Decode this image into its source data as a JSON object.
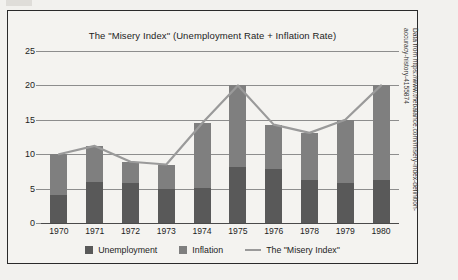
{
  "source_credit": {
    "line1": "Data from https://www.thebalance.com/misery-index-definition-",
    "line2": "accuracy-history-4155874"
  },
  "colors": {
    "unemployment": "#595959",
    "inflation": "#7f7f7f",
    "misery_line": "#9a9a9a",
    "grid": "#8d8d8d",
    "background": "#f4f3f0",
    "border": "#2a2a2a"
  },
  "chart_data": {
    "type": "bar",
    "title": "The \"Misery Index\" (Unemployment Rate + Inflation Rate)",
    "xlabel": "",
    "ylabel": "",
    "ylim": [
      0,
      25
    ],
    "yticks": [
      0,
      5,
      10,
      15,
      20,
      25
    ],
    "grid": true,
    "stacked": true,
    "legend_position": "bottom",
    "categories": [
      "1970",
      "1971",
      "1972",
      "1973",
      "1974",
      "1975",
      "1976",
      "1978",
      "1979",
      "1980"
    ],
    "series": [
      {
        "name": "Unemployment",
        "type": "bar",
        "values": [
          4.0,
          5.9,
          5.8,
          4.9,
          5.1,
          8.1,
          7.8,
          6.3,
          5.8,
          6.3
        ]
      },
      {
        "name": "Inflation",
        "type": "bar",
        "values": [
          6.0,
          5.3,
          3.1,
          3.6,
          9.4,
          11.9,
          6.5,
          6.8,
          9.2,
          13.7
        ]
      },
      {
        "name": "The \"Misery Index\"",
        "type": "line",
        "values": [
          10.0,
          11.2,
          8.9,
          8.5,
          14.5,
          20.0,
          14.3,
          13.1,
          15.0,
          20.0
        ]
      }
    ]
  }
}
